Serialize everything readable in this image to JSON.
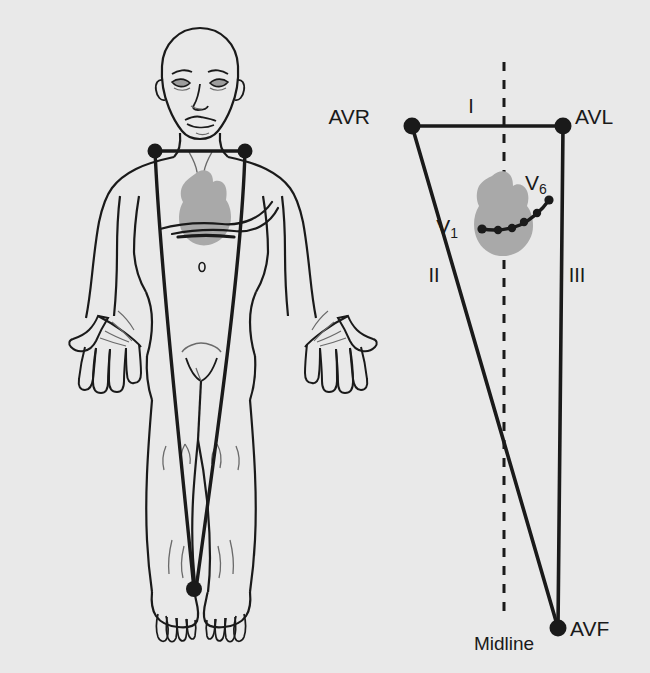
{
  "figure": {
    "background_color": "#e9e9e9",
    "ink_color": "#1a1a1a",
    "organ_fill_color": "#a9a9a9"
  },
  "body_panel": {
    "name": "anterior-human-figure",
    "description": "Front view outline of a standing adult male with limb-lead wires",
    "electrodes": [
      {
        "id": "right-shoulder-electrode",
        "x": 155,
        "y": 151
      },
      {
        "id": "left-shoulder-electrode",
        "x": 245,
        "y": 151
      },
      {
        "id": "left-ankle-electrode",
        "x": 194,
        "y": 589
      }
    ],
    "heart": {
      "x": 207,
      "y": 202
    }
  },
  "triangle_panel": {
    "name": "einthoven-triangle",
    "vertices": [
      {
        "label": "AVR",
        "node_x": 412,
        "node_y": 126,
        "label_x": 370,
        "label_y": 116
      },
      {
        "label": "AVL",
        "node_x": 563,
        "node_y": 126,
        "label_x": 575,
        "label_y": 116
      },
      {
        "label": "AVF",
        "node_x": 558,
        "node_y": 628,
        "label_x": 570,
        "label_y": 618
      }
    ],
    "leads": [
      {
        "label": "I",
        "x": 471,
        "y": 100
      },
      {
        "label": "II",
        "x": 432,
        "y": 267
      },
      {
        "label": "III",
        "x": 571,
        "y": 267
      }
    ],
    "midline": {
      "label": "Midline",
      "label_x": 474,
      "label_y": 634,
      "x": 504,
      "y_top": 62,
      "y_bottom": 620
    },
    "chest_leads": {
      "first": {
        "label": "V",
        "subscript": "1",
        "label_x": 461,
        "label_y": 217
      },
      "last": {
        "label": "V",
        "subscript": "6",
        "label_x": 537,
        "label_y": 173
      },
      "points": [
        {
          "x": 482,
          "y": 229
        },
        {
          "x": 498,
          "y": 230
        },
        {
          "x": 512,
          "y": 228
        },
        {
          "x": 524,
          "y": 222
        },
        {
          "x": 537,
          "y": 213
        },
        {
          "x": 549,
          "y": 200
        }
      ]
    },
    "heart": {
      "x": 507,
      "y": 205
    }
  }
}
